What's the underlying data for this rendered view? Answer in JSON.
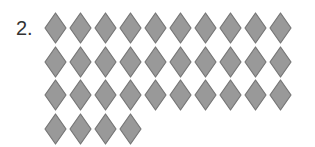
{
  "problem": {
    "number_label": "2.",
    "shape": "diamond",
    "rows": [
      10,
      10,
      10,
      4
    ],
    "total_count": 34,
    "colors": {
      "fill": "#999999",
      "stroke": "#767676",
      "label": "#333333"
    }
  }
}
